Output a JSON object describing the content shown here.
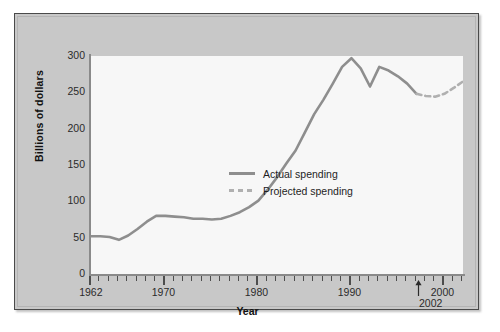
{
  "chart_data": {
    "type": "line",
    "title": "",
    "xlabel": "Year",
    "ylabel": "Billions of dollars",
    "xlim": [
      1962,
      2002
    ],
    "ylim": [
      0,
      300
    ],
    "yticks": [
      300,
      250,
      200,
      150,
      100,
      50,
      0
    ],
    "xticks_major": [
      1962,
      1970,
      1980,
      1990,
      2000
    ],
    "xtick_interval_minor": 1,
    "grid": false,
    "legend_position": "center-right-inside",
    "end_year_annotation": "2002",
    "series": [
      {
        "name": "Actual spending",
        "style": "solid",
        "color": "#8e8e8e",
        "x": [
          1962,
          1963,
          1964,
          1965,
          1966,
          1967,
          1968,
          1969,
          1970,
          1971,
          1972,
          1973,
          1974,
          1975,
          1976,
          1977,
          1978,
          1979,
          1980,
          1981,
          1982,
          1983,
          1984,
          1985,
          1986,
          1987,
          1988,
          1989,
          1990,
          1991,
          1992,
          1993,
          1994,
          1995,
          1996,
          1997
        ],
        "values": [
          52,
          52,
          51,
          47,
          53,
          62,
          72,
          80,
          80,
          79,
          78,
          76,
          76,
          75,
          76,
          80,
          85,
          92,
          101,
          116,
          133,
          152,
          170,
          195,
          220,
          240,
          262,
          285,
          297,
          283,
          258,
          285,
          280,
          272,
          262,
          248
        ]
      },
      {
        "name": "Projected spending",
        "style": "dashed",
        "color": "#b0b0b0",
        "x": [
          1997,
          1998,
          1999,
          2000,
          2001,
          2002
        ],
        "values": [
          248,
          245,
          244,
          248,
          256,
          265
        ]
      }
    ]
  },
  "legend": {
    "items": [
      {
        "label": "Actual spending",
        "style": "solid"
      },
      {
        "label": "Projected spending",
        "style": "dashed"
      }
    ]
  }
}
